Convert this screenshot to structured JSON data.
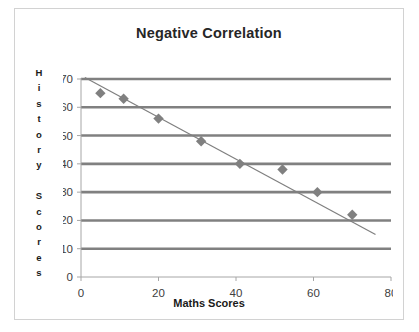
{
  "chart_data": {
    "type": "scatter",
    "title": "Negative Correlation",
    "xlabel": "Maths Scores",
    "ylabel": "History Scores",
    "ylabel_chars": [
      "H",
      "i",
      "s",
      "t",
      "o",
      "r",
      "y",
      "",
      "S",
      "c",
      "o",
      "r",
      "e",
      "s"
    ],
    "xlim": [
      0,
      80
    ],
    "ylim": [
      0,
      70
    ],
    "xticks": [
      0,
      20,
      40,
      60,
      80
    ],
    "yticks": [
      0,
      10,
      20,
      30,
      40,
      50,
      60,
      70
    ],
    "grid": "horizontal",
    "legend": "none",
    "x": [
      5,
      11,
      20,
      31,
      41,
      52,
      61,
      70
    ],
    "y": [
      65,
      63,
      56,
      48,
      40,
      38,
      30,
      22
    ],
    "points": [
      {
        "x": 5,
        "y": 65
      },
      {
        "x": 11,
        "y": 63
      },
      {
        "x": 20,
        "y": 56
      },
      {
        "x": 31,
        "y": 48
      },
      {
        "x": 41,
        "y": 40
      },
      {
        "x": 52,
        "y": 38
      },
      {
        "x": 61,
        "y": 30
      },
      {
        "x": 70,
        "y": 22
      }
    ],
    "trendline": {
      "x0": 1,
      "y0": 70.5,
      "x1": 76,
      "y1": 15.0
    },
    "marker": "diamond",
    "marker_color": "#808080",
    "trendline_color": "#7f7f7f",
    "gridline_color": "#808080",
    "axis_color": "#a6a6a6",
    "title_color": "#262626",
    "border_color": "#d2d2d2",
    "plot_background": "#ffffff"
  }
}
